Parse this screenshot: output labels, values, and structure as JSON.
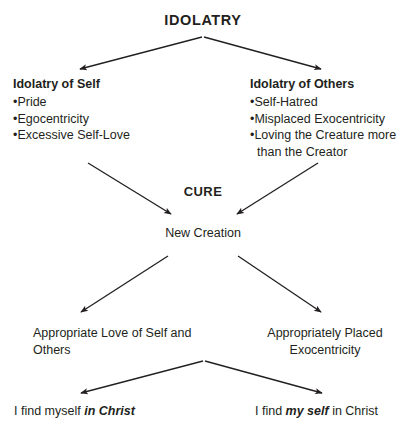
{
  "diagram": {
    "title": "IDOLATRY",
    "cure_label": "CURE",
    "center_node": "New Creation",
    "branches": {
      "left": {
        "heading": "Idolatry of Self",
        "items": [
          "Pride",
          "Egocentricity",
          "Excessive Self-Love"
        ]
      },
      "right": {
        "heading": "Idolatry of Others",
        "items": [
          "Self-Hatred",
          "Misplaced Exocentricity",
          "Loving the Creature more than the Creator"
        ]
      }
    },
    "outcomes": {
      "left": "Appropriate Love of Self and Others",
      "right": "Appropriately Placed Exocentricity"
    },
    "conclusions": {
      "left": {
        "prefix": "I find myself ",
        "emphasis": "in Christ",
        "suffix": ""
      },
      "right": {
        "prefix": "I find ",
        "emphasis": "my self",
        "suffix": " in Christ"
      }
    },
    "bullet_glyph": "•",
    "colors": {
      "ink": "#231f20",
      "background": "#ffffff"
    }
  }
}
